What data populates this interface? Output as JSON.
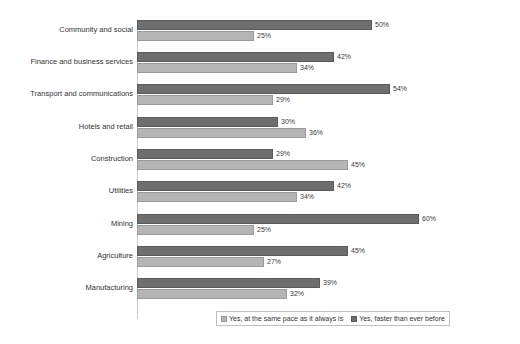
{
  "chart_data": {
    "type": "bar",
    "orientation": "horizontal",
    "title": "",
    "subtitle": "",
    "xlabel": "",
    "ylabel": "",
    "xlim": [
      0,
      65
    ],
    "grid": false,
    "legend_position": "bottom",
    "categories": [
      "Community and social",
      "Finance and business services",
      "Transport and communications",
      "Hotels and retail",
      "Construction",
      "Utilities",
      "Mining",
      "Agriculture",
      "Manufacturing"
    ],
    "series": [
      {
        "name": "Yes, faster than ever before",
        "color": "#6e6e6e",
        "values": [
          50,
          42,
          54,
          30,
          29,
          42,
          60,
          45,
          39
        ],
        "labels": [
          "50%",
          "42%",
          "54%",
          "30%",
          "29%",
          "42%",
          "60%",
          "45%",
          "39%"
        ]
      },
      {
        "name": "Yes, at the same pace as it always is",
        "color": "#b5b5b5",
        "values": [
          25,
          34,
          29,
          36,
          45,
          34,
          25,
          27,
          32
        ],
        "labels": [
          "25%",
          "34%",
          "29%",
          "36%",
          "45%",
          "34%",
          "25%",
          "27%",
          "32%"
        ]
      }
    ]
  },
  "legend": {
    "items": [
      {
        "label": "Yes, at the same pace as it always is",
        "swatch": "series-samepace"
      },
      {
        "label": "Yes, faster than ever before",
        "swatch": "series-faster"
      }
    ]
  }
}
